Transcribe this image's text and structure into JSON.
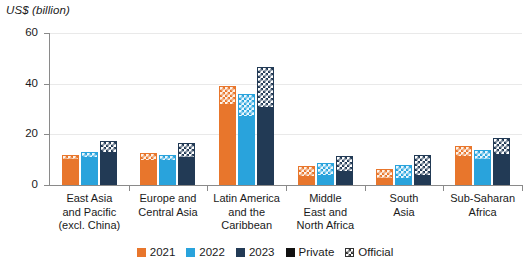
{
  "chart_data": {
    "type": "bar",
    "title": "",
    "subtitle": "",
    "ylabel": "US$ (billion)",
    "xlabel": "",
    "ylim": [
      0,
      60
    ],
    "yticks": [
      0,
      20,
      40,
      60
    ],
    "ytick_labels": [
      "0",
      "20",
      "40",
      "60"
    ],
    "grid": true,
    "grid_axis": "y",
    "stacked": true,
    "legend_position": "bottom",
    "legend": [
      {
        "label": "2021",
        "color": "#E8762C",
        "kind": "series"
      },
      {
        "label": "2022",
        "color": "#29A3DC",
        "kind": "series"
      },
      {
        "label": "2023",
        "color": "#223A55",
        "kind": "series"
      },
      {
        "label": "Private",
        "color": "#111111",
        "kind": "pattern-solid"
      },
      {
        "label": "Official",
        "color": "#333333",
        "kind": "pattern-checker"
      }
    ],
    "categories": [
      "East Asia and Pacific (excl. China)",
      "Europe and Central Asia",
      "Latin America and the Caribbean",
      "Middle East and North Africa",
      "South Asia",
      "Sub-Saharan Africa"
    ],
    "category_lines": [
      [
        "East Asia",
        "and Pacific",
        "(excl. China)"
      ],
      [
        "Europe and",
        "Central Asia"
      ],
      [
        "Latin America",
        "and the",
        "Caribbean"
      ],
      [
        "Middle",
        "East and",
        "North Africa"
      ],
      [
        "South",
        "Asia"
      ],
      [
        "Sub-Saharan",
        "Africa"
      ]
    ],
    "series": [
      {
        "name": "2021",
        "color": "#E8762C",
        "private": [
          10.0,
          9.5,
          31.5,
          3.0,
          2.5,
          11.0
        ],
        "official": [
          2.0,
          3.0,
          7.5,
          4.5,
          4.0,
          4.5
        ],
        "total": [
          12.0,
          12.5,
          39.0,
          7.5,
          6.5,
          15.5
        ]
      },
      {
        "name": "2022",
        "color": "#29A3DC",
        "private": [
          10.5,
          9.5,
          27.0,
          3.5,
          2.5,
          10.0
        ],
        "official": [
          2.5,
          2.5,
          9.0,
          5.0,
          5.5,
          4.0
        ],
        "total": [
          13.0,
          12.0,
          36.0,
          8.5,
          8.0,
          14.0
        ]
      },
      {
        "name": "2023",
        "color": "#223A55",
        "private": [
          12.5,
          10.5,
          30.5,
          5.0,
          3.5,
          12.0
        ],
        "official": [
          5.0,
          6.0,
          16.0,
          6.5,
          8.5,
          6.5
        ],
        "total": [
          17.5,
          16.5,
          46.5,
          11.5,
          12.0,
          18.5
        ]
      }
    ]
  }
}
